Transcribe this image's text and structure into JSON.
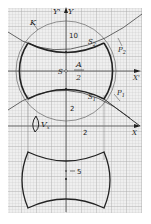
{
  "figure": {
    "type": "geometric construction on graph paper",
    "colors": {
      "paper": "#f2f2f2",
      "grid_minor": "#c8c8c8",
      "grid_major": "#a8a8a8",
      "ink": "#222222",
      "thin_ink": "#555555"
    }
  },
  "labels": {
    "y_prime_axis": "Y'",
    "y_axis": "Y",
    "x_prime_axis": "X'",
    "x_axis": "X",
    "curve_k": "K",
    "point_s": "S",
    "point_s1": "S",
    "point_s1_sub": "1",
    "point_s2": "S",
    "point_s2_sub": "2",
    "point_p1": "P",
    "point_p1_sub": "1",
    "point_p2": "P",
    "point_p2_sub": "2",
    "fraction_num": "A",
    "fraction_den": "2",
    "rotation_symbol": "V",
    "rotation_sub": "x",
    "tick_10": "10",
    "tick_2_upper": "2",
    "tick_2_lower": "2",
    "tick_5": "5"
  }
}
